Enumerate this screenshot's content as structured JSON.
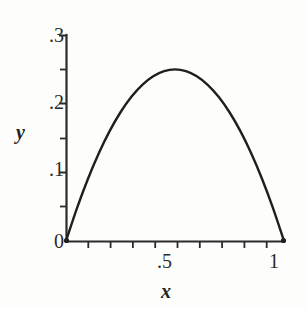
{
  "figure": {
    "background_color": "#fdfdfc",
    "ink_color": "#2b2b2b",
    "curve_color": "#1f1f1f"
  },
  "axes": {
    "x_title": "x",
    "y_title": "y",
    "origin_label": "0",
    "x_labels": {
      "zero": "0",
      "half": ".5",
      "one": "1"
    },
    "y_labels": {
      "one_tenth": ".1",
      "two_tenths": ".2",
      "three_tenths": ".3"
    }
  },
  "chart_data": {
    "type": "line",
    "title": "",
    "subtitle": "",
    "xlabel": "x",
    "ylabel": "y",
    "xlim": [
      0,
      1
    ],
    "ylim": [
      0,
      0.3
    ],
    "grid": false,
    "legend": false,
    "legend_position": "none",
    "x_tick_labels": [
      "0",
      ".5",
      "1"
    ],
    "x_tick_values": [
      0,
      0.5,
      1
    ],
    "x_minor_tick_values": [
      0.1,
      0.2,
      0.3,
      0.4,
      0.5,
      0.6,
      0.7,
      0.8,
      0.9
    ],
    "y_tick_labels": [
      "0",
      ".1",
      ".2",
      ".3"
    ],
    "y_tick_values": [
      0,
      0.1,
      0.2,
      0.3
    ],
    "y_minor_tick_values": [
      0.05,
      0.15,
      0.25
    ],
    "annotations": [],
    "series": [
      {
        "name": "y = x(1 - x)",
        "x": [
          0,
          0.05,
          0.1,
          0.15,
          0.2,
          0.25,
          0.3,
          0.35,
          0.4,
          0.45,
          0.5,
          0.55,
          0.6,
          0.65,
          0.7,
          0.75,
          0.8,
          0.85,
          0.9,
          0.95,
          1
        ],
        "values": [
          0,
          0.0475,
          0.09,
          0.1275,
          0.16,
          0.1875,
          0.21,
          0.2275,
          0.24,
          0.2475,
          0.25,
          0.2475,
          0.24,
          0.2275,
          0.21,
          0.1875,
          0.16,
          0.1275,
          0.09,
          0.0475,
          0
        ]
      }
    ],
    "peak": {
      "x": 0.5,
      "y": 0.25
    },
    "roots": [
      0,
      1
    ]
  }
}
